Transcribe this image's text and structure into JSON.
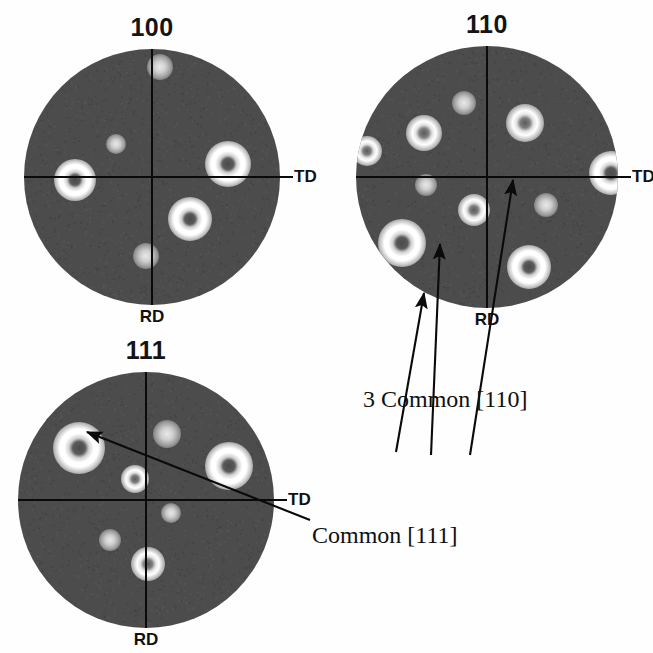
{
  "figure": {
    "background_color": "#fefefe",
    "disk_color": "#4d4d4d",
    "axis_color": "#0a0a0a",
    "pole_color": "#ffffff"
  },
  "annotations": [
    {
      "id": "common110",
      "text": "3 Common [110]",
      "x": 363,
      "y": 387
    },
    {
      "id": "common111",
      "text": "Common [111]",
      "x": 312,
      "y": 523
    }
  ],
  "chart_data": {
    "type": "scatter",
    "axis_labels": {
      "vertical_bottom": "RD",
      "horizontal_right": "TD"
    },
    "panels": [
      {
        "name": "pole-figure-100",
        "title": "100",
        "center": [
          152,
          177
        ],
        "radius": 128,
        "td_label": "TD",
        "rd_label": "RD",
        "poles": [
          {
            "r": 0.6,
            "theta_deg": 10,
            "size": 46,
            "strength": "strong"
          },
          {
            "r": 0.86,
            "theta_deg": 86,
            "size": 26,
            "strength": "weak"
          },
          {
            "r": 0.6,
            "theta_deg": 182,
            "size": 42,
            "strength": "strong"
          },
          {
            "r": 0.38,
            "theta_deg": 138,
            "size": 20,
            "strength": "weak"
          },
          {
            "r": 0.44,
            "theta_deg": 312,
            "size": 44,
            "strength": "strong"
          },
          {
            "r": 0.62,
            "theta_deg": 266,
            "size": 26,
            "strength": "weak"
          }
        ]
      },
      {
        "name": "pole-figure-110",
        "title": "110",
        "center": [
          487,
          177
        ],
        "radius": 131,
        "td_label": "TD",
        "rd_label": "RD",
        "poles": [
          {
            "r": 0.59,
            "theta_deg": 107,
            "size": 24,
            "strength": "weak"
          },
          {
            "r": 0.59,
            "theta_deg": 145,
            "size": 36,
            "strength": "medium"
          },
          {
            "r": 0.94,
            "theta_deg": 168,
            "size": 30,
            "strength": "medium"
          },
          {
            "r": 0.47,
            "theta_deg": 187,
            "size": 22,
            "strength": "weak"
          },
          {
            "r": 0.5,
            "theta_deg": 55,
            "size": 38,
            "strength": "medium"
          },
          {
            "r": 0.95,
            "theta_deg": 2,
            "size": 44,
            "strength": "strong"
          },
          {
            "r": 0.5,
            "theta_deg": 335,
            "size": 24,
            "strength": "weak"
          },
          {
            "r": 0.27,
            "theta_deg": 249,
            "size": 32,
            "strength": "medium"
          },
          {
            "r": 0.82,
            "theta_deg": 218,
            "size": 48,
            "strength": "strong"
          },
          {
            "r": 0.76,
            "theta_deg": 295,
            "size": 44,
            "strength": "strong"
          }
        ]
      },
      {
        "name": "pole-figure-111",
        "title": "111",
        "center": [
          146,
          500
        ],
        "radius": 128,
        "td_label": "TD",
        "rd_label": "RD",
        "poles": [
          {
            "r": 0.66,
            "theta_deg": 142,
            "size": 52,
            "strength": "strong"
          },
          {
            "r": 0.54,
            "theta_deg": 72,
            "size": 28,
            "strength": "weak"
          },
          {
            "r": 0.7,
            "theta_deg": 22,
            "size": 48,
            "strength": "strong"
          },
          {
            "r": 0.19,
            "theta_deg": 118,
            "size": 28,
            "strength": "medium"
          },
          {
            "r": 0.22,
            "theta_deg": 332,
            "size": 20,
            "strength": "weak"
          },
          {
            "r": 0.42,
            "theta_deg": 228,
            "size": 22,
            "strength": "weak"
          },
          {
            "r": 0.5,
            "theta_deg": 272,
            "size": 34,
            "strength": "medium"
          }
        ]
      }
    ],
    "leader_arrows": [
      {
        "id": "arrow-110-a",
        "from": [
          396,
          452
        ],
        "to": [
          424,
          293
        ],
        "target": "lower-left strong pole of 110"
      },
      {
        "id": "arrow-110-b",
        "from": [
          431,
          455
        ],
        "to": [
          440,
          244
        ],
        "target": "central pole of 110"
      },
      {
        "id": "arrow-110-c",
        "from": [
          470,
          455
        ],
        "to": [
          513,
          180
        ],
        "target": "upper-right pole of 110"
      },
      {
        "id": "arrow-111-a",
        "from": [
          310,
          520
        ],
        "to": [
          87,
          432
        ],
        "target": "upper-left strong pole of 111"
      }
    ]
  }
}
